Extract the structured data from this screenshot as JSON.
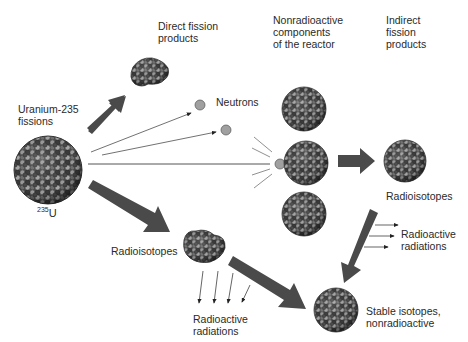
{
  "labels": {
    "uranium_fissions": "Uranium-235\nfissions",
    "u235_sup": "235",
    "u235_symbol": "U",
    "direct_fission_products": "Direct fission\nproducts",
    "neutrons": "Neutrons",
    "nonradioactive_components": "Nonradioactive\ncomponents\nof the reactor",
    "indirect_fission_products": "Indirect\nfission\nproducts",
    "radioisotopes_right": "Radioisotopes",
    "radioactive_radiations_right": "Radioactive\nradiations",
    "radioisotopes_left": "Radioisotopes",
    "radioactive_radiations_bottom": "Radioactive\nradiations",
    "stable_isotopes": "Stable isotopes,\nnonradioactive"
  },
  "colors": {
    "arrow_fill": "#4a4a4a",
    "nucleus_light": "#9a9a9a",
    "nucleus_dark": "#3a3a3a",
    "nucleus_mid": "#6a6a6a",
    "neutron": "#a0a0a0",
    "line": "#333333",
    "text": "#2a2a2a"
  }
}
